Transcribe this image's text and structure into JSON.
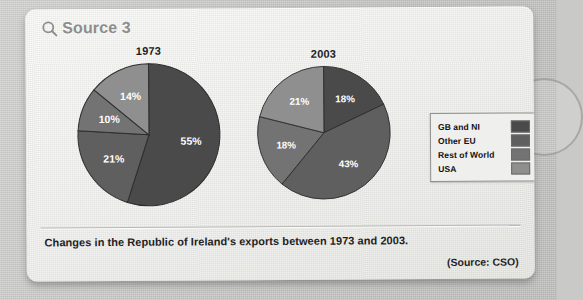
{
  "header": {
    "icon": "magnifier-icon",
    "title": "Source 3"
  },
  "caption": "Changes in the Republic of Ireland's exports between 1973 and 2003.",
  "attribution": "(Source: CSO)",
  "legend": {
    "items": [
      {
        "label": "GB and NI",
        "color": "#4a4a4a"
      },
      {
        "label": "Other EU",
        "color": "#5f5f5f"
      },
      {
        "label": "Rest of World",
        "color": "#737373"
      },
      {
        "label": "USA",
        "color": "#8f8f8f"
      }
    ]
  },
  "chart_data": [
    {
      "type": "pie",
      "title": "1973",
      "categories": [
        "GB and NI",
        "Other EU",
        "Rest of World",
        "USA"
      ],
      "values": [
        55,
        21,
        10,
        14
      ],
      "labels": [
        "55%",
        "21%",
        "10%",
        "14%"
      ],
      "colors": [
        "#4a4a4a",
        "#5f5f5f",
        "#737373",
        "#8f8f8f"
      ],
      "start_angle": 0,
      "legend": "right"
    },
    {
      "type": "pie",
      "title": "2003",
      "categories": [
        "GB and NI",
        "Other EU",
        "Rest of World",
        "USA"
      ],
      "values": [
        18,
        43,
        18,
        21
      ],
      "labels": [
        "18%",
        "43%",
        "18%",
        "21%"
      ],
      "colors": [
        "#4a4a4a",
        "#5f5f5f",
        "#737373",
        "#8f8f8f"
      ],
      "start_angle": 0,
      "legend": "right"
    }
  ]
}
